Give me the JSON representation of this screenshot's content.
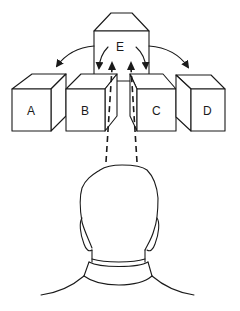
{
  "diagram": {
    "boxes": [
      {
        "id": "A",
        "label": "A"
      },
      {
        "id": "B",
        "label": "B"
      },
      {
        "id": "C",
        "label": "C"
      },
      {
        "id": "D",
        "label": "D"
      },
      {
        "id": "E",
        "label": "E"
      }
    ],
    "arrows": [
      {
        "from": "E",
        "to": "A"
      },
      {
        "from": "E",
        "to": "B"
      },
      {
        "from": "E",
        "to": "C"
      },
      {
        "from": "E",
        "to": "D"
      }
    ],
    "sight_lines": [
      {
        "from": "head",
        "to": "E",
        "style": "dashed"
      },
      {
        "from": "head",
        "to": "E",
        "style": "dashed"
      }
    ],
    "figure": "back of observer's head and shoulders",
    "colors": {
      "stroke": "#1a1a1a",
      "background": "#ffffff"
    }
  }
}
